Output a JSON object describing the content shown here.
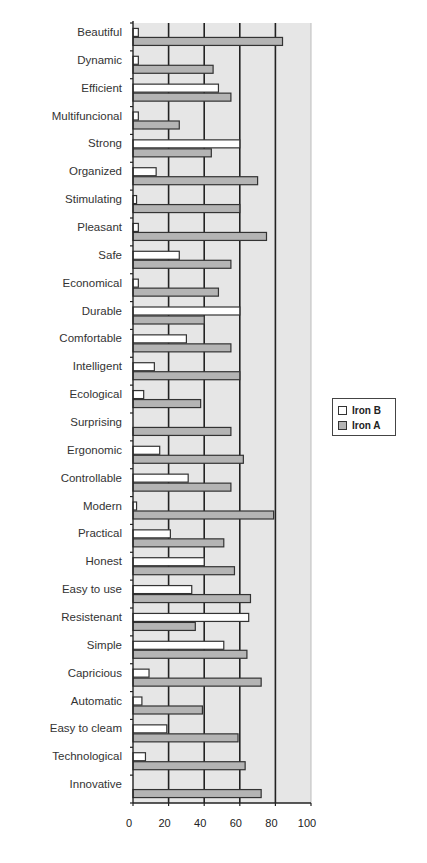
{
  "chart_data": {
    "type": "bar",
    "orientation": "horizontal",
    "title": "",
    "xlabel": "",
    "ylabel": "",
    "xlim": [
      0,
      100
    ],
    "x_ticks": [
      0,
      20,
      40,
      60,
      80,
      100
    ],
    "x_tick_labels": [
      "0",
      "20",
      "40",
      "60",
      "80",
      "100"
    ],
    "grid": {
      "vertical": true,
      "at": [
        20,
        40,
        60,
        80
      ]
    },
    "legend_position": "right",
    "categories": [
      "Beautiful",
      "Dynamic",
      "Efficient",
      "Multifuncional",
      "Strong",
      "Organized",
      "Stimulating",
      "Pleasant",
      "Safe",
      "Economical",
      "Durable",
      "Comfortable",
      "Intelligent",
      "Ecological",
      "Surprising",
      "Ergonomic",
      "Controllable",
      "Modern",
      "Practical",
      "Honest",
      "Easy to use",
      "Resistenant",
      "Simple",
      "Capricious",
      "Automatic",
      "Easy to cleam",
      "Technological",
      "Innovative"
    ],
    "series": [
      {
        "name": "Iron B",
        "color": "#ffffff",
        "values": [
          3,
          3,
          48,
          3,
          60,
          13,
          2,
          3,
          26,
          3,
          60,
          30,
          12,
          6,
          0,
          15,
          31,
          2,
          21,
          40,
          33,
          65,
          51,
          9,
          5,
          19,
          7,
          0
        ]
      },
      {
        "name": "Iron A",
        "color": "#b4b4b4",
        "values": [
          84,
          45,
          55,
          26,
          44,
          70,
          60,
          75,
          55,
          48,
          40,
          55,
          60,
          38,
          55,
          62,
          55,
          79,
          51,
          57,
          66,
          35,
          64,
          72,
          39,
          59,
          63,
          72
        ]
      }
    ]
  },
  "legend": {
    "items": [
      {
        "label": "Iron B",
        "color": "#ffffff"
      },
      {
        "label": "Iron A",
        "color": "#b4b4b4"
      }
    ]
  },
  "colors": {
    "plot_background": "#e6e6e6",
    "gridline": "#222222",
    "bar_border": "#333333",
    "axis": "#222222"
  }
}
